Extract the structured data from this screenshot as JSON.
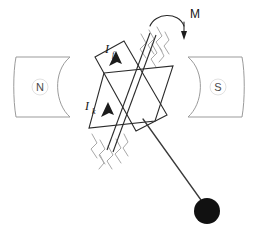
{
  "figure": {
    "background_color": "#ffffff"
  },
  "magnets": {
    "north": {
      "letter": "N",
      "label_name": "north-pole",
      "stroke_color": "#9b9b9b",
      "x": 16,
      "y": 56,
      "width": 56,
      "height": 62
    },
    "south": {
      "letter": "S",
      "label_name": "south-pole",
      "stroke_color": "#9b9b9b",
      "x": 186,
      "y": 56,
      "width": 56,
      "height": 62
    }
  },
  "coil": {
    "name": "rotating-coil",
    "stroke_color": "#2b2b2b",
    "description": "two overlapping parallelogram loops forming a star outline"
  },
  "axle": {
    "name": "pivot-axle",
    "stroke_color": "#2b2b2b",
    "hatch_color": "#a8a8a8"
  },
  "labels": {
    "current_top": {
      "symbol": "I",
      "subscript": "f",
      "full": "I_f"
    },
    "current_bottom": {
      "symbol": "I",
      "subscript": "k",
      "full": "I_k"
    },
    "torque": {
      "symbol": "M",
      "full": "M"
    }
  },
  "pendulum": {
    "name": "pendulum-bob",
    "rod_color": "#3a3a3a",
    "bob_color": "#111111",
    "bob_cx": 207,
    "bob_cy": 211,
    "bob_r": 13
  }
}
